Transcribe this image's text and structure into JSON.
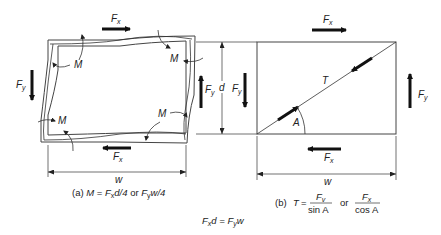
{
  "figure_a": {
    "moment_label": "M",
    "fx_label_main": "F",
    "fx_label_sub": "x",
    "fy_label_main": "F",
    "fy_label_sub": "y",
    "width_label": "w",
    "caption": {
      "prefix": "(a) ",
      "m": "M",
      "eq": " = ",
      "f1": "F",
      "f1sub": "x",
      "t1": "d/4",
      "or": " or ",
      "f2": "F",
      "f2sub": "y",
      "t2": "w/4"
    }
  },
  "figure_b": {
    "fx_label_main": "F",
    "fx_label_sub": "x",
    "fy_label_main": "F",
    "fy_label_sub": "y",
    "tension_label": "T",
    "angle_label": "A",
    "depth_label": "d",
    "width_label": "w",
    "caption": {
      "prefix": "(b)",
      "t": "T",
      "eq": "=",
      "num1": "F",
      "num1sub": "v",
      "den1": "sin A",
      "or": "or",
      "num2": "F",
      "num2sub": "x",
      "den2": "cos A"
    }
  },
  "equilibrium": {
    "f1": "F",
    "f1sub": "x",
    "t1": "d = ",
    "f2": "F",
    "f2sub": "y",
    "t2": "w"
  }
}
